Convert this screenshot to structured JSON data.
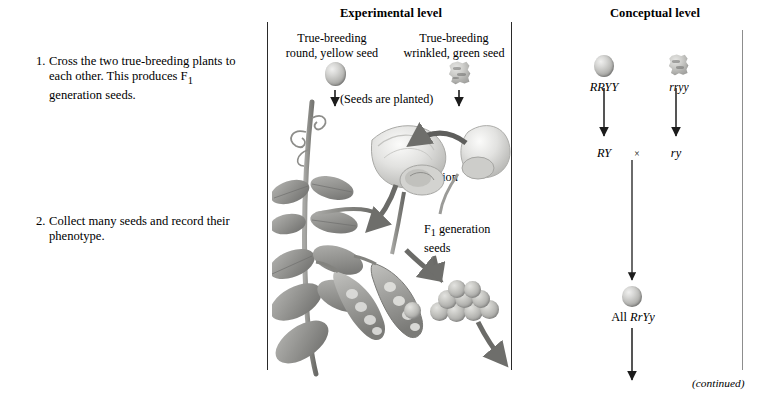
{
  "figure": {
    "title_experimental": "Experimental level",
    "title_conceptual": "Conceptual level",
    "continued_note": "(continued)"
  },
  "steps": [
    {
      "number": "1.",
      "text": "Cross the two true-breeding plants to each other. This produces F1 generation seeds."
    },
    {
      "number": "2.",
      "text": "Collect many seeds and record their phenotype."
    }
  ],
  "experimental": {
    "parent_left": {
      "line1": "True-breeding",
      "line2": "round, yellow seed",
      "seed_type": "round-seed-icon"
    },
    "parent_right": {
      "line1": "True-breeding",
      "line2": "wrinkled, green seed",
      "seed_type": "wrinkled-seed-icon"
    },
    "planted_label": "(Seeds are planted)",
    "cross_pollination_line1": "Cross-",
    "cross_pollination_line2": "pollination",
    "f1_seeds_line1": "F1 generation",
    "f1_seeds_line2": "seeds"
  },
  "conceptual": {
    "parent_left_genotype": "RRYY",
    "parent_right_genotype": "rryy",
    "gamete_left": "RY",
    "gamete_right": "ry",
    "cross_symbol": "×",
    "offspring_prefix": "All ",
    "offspring_genotype": "RrYy"
  },
  "colors": {
    "rule_dark": "#2a2a2a",
    "rule_light": "#8d8d8d",
    "text": "#000000",
    "plant_mid": "#9a9a97",
    "plant_dark": "#6f6f6d",
    "seed_light": "#d8d8d6"
  }
}
